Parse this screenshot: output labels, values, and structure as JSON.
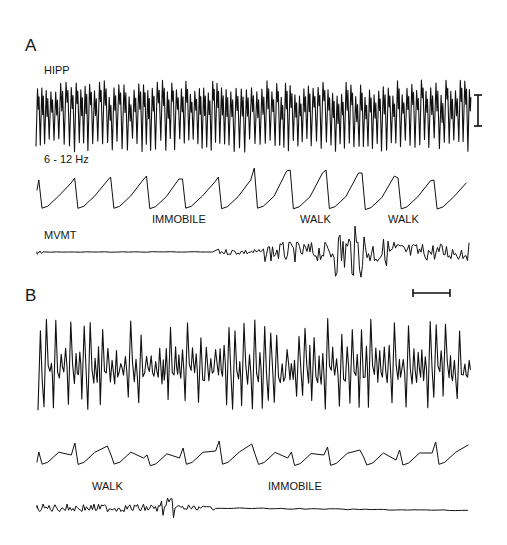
{
  "figure": {
    "panels": [
      {
        "id": "A",
        "label": "A",
        "trace_labels": {
          "hipp": "HIPP",
          "theta": "6 - 12 Hz",
          "movement": "MVMT"
        },
        "state_annotations": [
          {
            "text": "IMMOBILE",
            "x": 152
          },
          {
            "text": "WALK",
            "x": 300
          },
          {
            "text": "WALK",
            "x": 388
          }
        ],
        "amplitude_scale_bar": "vertical",
        "time_scale_bar": "horizontal"
      },
      {
        "id": "B",
        "label": "B",
        "state_annotations": [
          {
            "text": "WALK",
            "x": 92
          },
          {
            "text": "IMMOBILE",
            "x": 268
          }
        ]
      }
    ],
    "colors": {
      "trace": "#111111",
      "background": "#ffffff"
    }
  }
}
